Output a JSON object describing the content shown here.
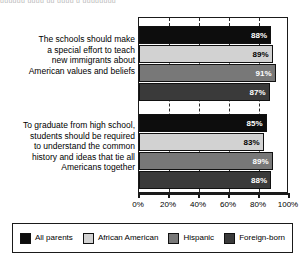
{
  "top_cutoff_text": "uuuuuu uuuu uu uuuu u uuuuuuuu",
  "chart_data": {
    "type": "bar",
    "orientation": "horizontal",
    "title": "",
    "xlabel": "",
    "ylabel": "",
    "xlim": [
      0,
      100
    ],
    "grid": true,
    "legend_position": "bottom",
    "categories": [
      "The schools should make a special effort to teach new immigrants about American values and beliefs",
      "To graduate from high school, students should be required to understand the common history and ideas that tie all Americans together"
    ],
    "series": [
      {
        "name": "All parents",
        "color": "#0d0d0d",
        "values": [
          88,
          85
        ]
      },
      {
        "name": "African American",
        "color": "#d2d2d2",
        "values": [
          89,
          83
        ]
      },
      {
        "name": "Hispanic",
        "color": "#787878",
        "values": [
          91,
          89
        ]
      },
      {
        "name": "Foreign-born",
        "color": "#3a3a3a",
        "values": [
          87,
          88
        ]
      }
    ],
    "value_labels": [
      [
        "88%",
        "89%",
        "91%",
        "87%"
      ],
      [
        "85%",
        "83%",
        "89%",
        "88%"
      ]
    ],
    "xticks": [
      0,
      20,
      40,
      60,
      80,
      100
    ],
    "xticklabels": [
      "0%",
      "20%",
      "40%",
      "60%",
      "80%",
      "100%"
    ]
  },
  "axis": {
    "ticks": [
      {
        "value": 0,
        "label": "0%"
      },
      {
        "value": 20,
        "label": "20%"
      },
      {
        "value": 40,
        "label": "40%"
      },
      {
        "value": 60,
        "label": "60%"
      },
      {
        "value": 80,
        "label": "80%"
      },
      {
        "value": 100,
        "label": "100%"
      }
    ]
  },
  "legend": {
    "items": [
      {
        "label": "All parents",
        "color": "#0d0d0d"
      },
      {
        "label": "African American",
        "color": "#d2d2d2"
      },
      {
        "label": "Hispanic",
        "color": "#787878"
      },
      {
        "label": "Foreign-born",
        "color": "#3a3a3a"
      }
    ]
  },
  "category_labels": [
    {
      "lines": [
        "The schools should make",
        "a special effort to teach",
        "new immigrants about",
        "American values and beliefs"
      ]
    },
    {
      "lines": [
        "To graduate from high school,",
        "students should be required",
        "to understand the common",
        "history and ideas that tie all",
        "Americans together"
      ]
    }
  ]
}
